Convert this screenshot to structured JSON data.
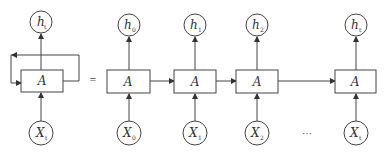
{
  "diagram": {
    "type": "rnn-unrolled",
    "colors": {
      "stroke": "#444444",
      "text": "#333333",
      "background": "#ffffff"
    },
    "equals": "=",
    "ellipsis": "···",
    "rolled": {
      "cell_label": "A",
      "output": {
        "main": "h",
        "sub": "t"
      },
      "input": {
        "main": "X",
        "sub": "t"
      }
    },
    "unrolled": [
      {
        "cell_label": "A",
        "output": {
          "main": "h",
          "sub": "0"
        },
        "input": {
          "main": "X",
          "sub": "0"
        }
      },
      {
        "cell_label": "A",
        "output": {
          "main": "h",
          "sub": "1"
        },
        "input": {
          "main": "X",
          "sub": "1"
        }
      },
      {
        "cell_label": "A",
        "output": {
          "main": "h",
          "sub": "2"
        },
        "input": {
          "main": "X",
          "sub": "2"
        }
      },
      {
        "cell_label": "A",
        "output": {
          "main": "h",
          "sub": "t"
        },
        "input": {
          "main": "X",
          "sub": "t"
        }
      }
    ]
  }
}
